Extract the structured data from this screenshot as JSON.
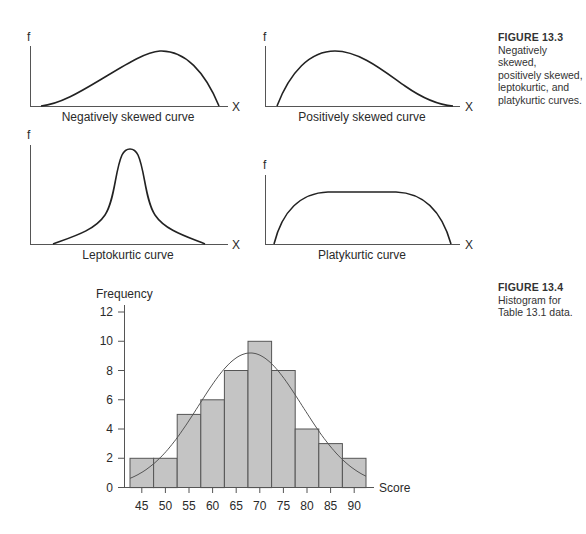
{
  "figure_13_3": {
    "number": "FIGURE 13.3",
    "caption_lines": [
      "Negatively skewed,",
      "positively skewed,",
      "leptokurtic, and",
      "platykurtic curves."
    ],
    "panels": [
      {
        "id": "negatively-skewed",
        "label": "Negatively skewed curve",
        "y_axis": "f",
        "x_axis": "X"
      },
      {
        "id": "positively-skewed",
        "label": "Positively skewed curve",
        "y_axis": "f",
        "x_axis": "X"
      },
      {
        "id": "leptokurtic",
        "label": "Leptokurtic curve",
        "y_axis": "f",
        "x_axis": "X"
      },
      {
        "id": "platykurtic",
        "label": "Platykurtic curve",
        "y_axis": "f",
        "x_axis": "X"
      }
    ]
  },
  "figure_13_4": {
    "number": "FIGURE 13.4",
    "caption_lines": [
      "Histogram for",
      "Table 13.1 data."
    ]
  },
  "colors": {
    "bar_fill": "#c4c4c4",
    "bar_stroke": "#555555",
    "axis": "#555555",
    "curve": "#222222",
    "normal_curve": "#555555"
  },
  "chart_data": [
    {
      "type": "line",
      "title": "Negatively skewed curve",
      "xlabel": "X",
      "ylabel": "f",
      "description": "Long left tail, peak toward the right"
    },
    {
      "type": "line",
      "title": "Positively skewed curve",
      "xlabel": "X",
      "ylabel": "f",
      "description": "Peak toward the left, long right tail"
    },
    {
      "type": "line",
      "title": "Leptokurtic curve",
      "xlabel": "X",
      "ylabel": "f",
      "description": "Tall narrow peak with heavy tails"
    },
    {
      "type": "line",
      "title": "Platykurtic curve",
      "xlabel": "X",
      "ylabel": "f",
      "description": "Flat broad plateau"
    },
    {
      "type": "bar",
      "title": "Histogram for Table 13.1 data",
      "xlabel": "Score",
      "ylabel": "Frequency",
      "categories": [
        "45",
        "50",
        "55",
        "60",
        "65",
        "70",
        "75",
        "80",
        "85",
        "90"
      ],
      "values": [
        2,
        2,
        5,
        6,
        8,
        10,
        8,
        4,
        3,
        2
      ],
      "yticks": [
        0,
        2,
        4,
        6,
        8,
        10,
        12
      ],
      "ylim": [
        0,
        12
      ],
      "overlay": "normal curve, peak ≈ 9.2 near score 68",
      "grid": false
    }
  ]
}
